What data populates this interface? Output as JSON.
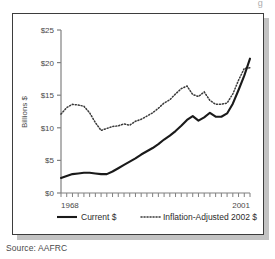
{
  "clipped_title_fragment": "g",
  "source_note": "Source: AAFRC",
  "chart_data": {
    "type": "line",
    "title": "",
    "xlabel": "",
    "ylabel": "Billions $",
    "xlim": [
      1968,
      2001
    ],
    "ylim": [
      0,
      25
    ],
    "grid": false,
    "legend_position": "bottom",
    "y_tick_labels": [
      "$0",
      "$5",
      "$10",
      "$15",
      "$20",
      "$25"
    ],
    "y_tick_values": [
      0,
      5,
      10,
      15,
      20,
      25
    ],
    "x_tick_labels": [
      "1968",
      "2001"
    ],
    "x_tick_values": [
      1968,
      2001
    ],
    "x": [
      1968,
      1969,
      1970,
      1971,
      1972,
      1973,
      1974,
      1975,
      1976,
      1977,
      1978,
      1979,
      1980,
      1981,
      1982,
      1983,
      1984,
      1985,
      1986,
      1987,
      1988,
      1989,
      1990,
      1991,
      1992,
      1993,
      1994,
      1995,
      1996,
      1997,
      1998,
      1999,
      2000,
      2001
    ],
    "series": [
      {
        "name": "Current $",
        "style": "solid",
        "color": "#1a1a1a",
        "values": [
          2.3,
          2.6,
          2.9,
          3.0,
          3.1,
          3.1,
          3.0,
          2.9,
          2.9,
          3.3,
          3.8,
          4.3,
          4.8,
          5.3,
          5.9,
          6.4,
          6.9,
          7.5,
          8.2,
          8.8,
          9.5,
          10.3,
          11.2,
          11.8,
          11.1,
          11.6,
          12.3,
          11.7,
          11.7,
          12.2,
          13.7,
          15.8,
          18.0,
          20.6
        ]
      },
      {
        "name": "Inflation-Adjusted 2002 $",
        "style": "dotted",
        "color": "#3a3a3a",
        "values": [
          12.1,
          13.1,
          13.6,
          13.5,
          13.3,
          12.3,
          10.8,
          9.6,
          9.9,
          10.2,
          10.3,
          10.6,
          10.4,
          11.0,
          11.3,
          11.8,
          12.3,
          13.0,
          13.8,
          14.3,
          15.2,
          16.0,
          16.4,
          15.1,
          14.8,
          15.5,
          14.2,
          13.6,
          13.6,
          13.8,
          15.2,
          17.3,
          19.1,
          19.2
        ]
      }
    ]
  }
}
